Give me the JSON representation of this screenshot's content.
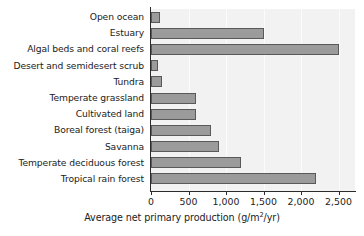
{
  "chart_data": {
    "type": "bar",
    "orientation": "horizontal",
    "title": "",
    "xlabel": "Average net primary production (g/m2/yr)",
    "xlabel_parts": {
      "before": "Average net primary production (g/m",
      "superscript": "2",
      "after": "/yr)"
    },
    "ylabel": "",
    "categories": [
      "Open ocean",
      "Estuary",
      "Algal beds and coral reefs",
      "Desert and semidesert scrub",
      "Tundra",
      "Temperate grassland",
      "Cultivated land",
      "Boreal forest (taiga)",
      "Savanna",
      "Temperate deciduous forest",
      "Tropical rain forest"
    ],
    "values": [
      125,
      1500,
      2500,
      90,
      140,
      600,
      600,
      800,
      900,
      1200,
      2200
    ],
    "xlim": [
      0,
      2720
    ],
    "xticks": [
      0,
      500,
      1000,
      1500,
      2000,
      2500
    ],
    "xtick_labels": [
      "0",
      "500",
      "1,000",
      "1,500",
      "2,000",
      "2,500"
    ],
    "grid": "vertical-faint",
    "legend": "none",
    "colors": {
      "bar_fill": "#9b9b9b",
      "bar_border": "#595959",
      "plot_background": "#f2f2f2",
      "axis": "#2b2b2b",
      "text": "#1b1b1b",
      "gridline": "#fbfbfb"
    }
  }
}
